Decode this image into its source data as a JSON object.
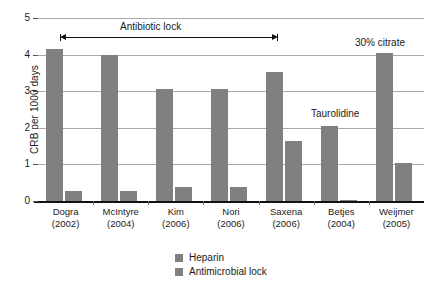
{
  "chart_data": {
    "type": "bar",
    "title": "",
    "xlabel": "",
    "ylabel": "CRB per 1000 days",
    "ylim": [
      0,
      5
    ],
    "ytick_labels": [
      "0",
      "1",
      "2",
      "3",
      "4",
      "5"
    ],
    "ytick_values": [
      0,
      1,
      2,
      3,
      4,
      5
    ],
    "grid": true,
    "legend_position": "bottom-center",
    "categories": [
      "Dogra (2002)",
      "McIntyre (2004)",
      "Kim (2006)",
      "Nori (2006)",
      "Saxena (2006)",
      "Betjes (2004)",
      "Weijmer (2005)"
    ],
    "category_names": [
      "Dogra",
      "McIntyre",
      "Kim",
      "Nori",
      "Saxena",
      "Betjes",
      "Weijmer"
    ],
    "category_years": [
      "(2002)",
      "(2004)",
      "(2006)",
      "(2006)",
      "(2006)",
      "(2004)",
      "(2005)"
    ],
    "series": [
      {
        "name": "Heparin",
        "color": "#808080",
        "values": [
          4.15,
          4.0,
          3.05,
          3.05,
          3.53,
          2.05,
          4.05
        ]
      },
      {
        "name": "Antimicrobial lock",
        "color": "#808080",
        "values": [
          0.27,
          0.28,
          0.37,
          0.38,
          1.65,
          0.03,
          1.05
        ]
      }
    ],
    "annotations": [
      {
        "text": "Antibiotic lock",
        "kind": "double-arrow-label",
        "spans_categories": [
          "Dogra (2002)",
          "Saxena (2006)"
        ],
        "y_value": 4.3
      },
      {
        "text": "Taurolidine",
        "kind": "label",
        "over_category": "Betjes (2004)",
        "y_value": 2.3
      },
      {
        "text": "30% citrate",
        "kind": "label",
        "over_category": "Weijmer (2005)",
        "y_value": 4.4
      }
    ]
  },
  "legend": {
    "items": [
      {
        "label": "Heparin",
        "color": "#808080"
      },
      {
        "label": "Antimicrobial lock",
        "color": "#808080"
      }
    ]
  },
  "axes": {
    "y_title": "CRB per 1000 days"
  },
  "colors": {
    "bar": "#808080",
    "gridline": "#a8a8a8",
    "axis": "#111111",
    "text": "#1a1a1a",
    "background": "#ffffff"
  }
}
